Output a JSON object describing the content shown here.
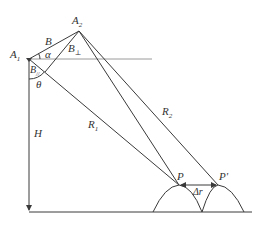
{
  "diagram": {
    "points": {
      "A1": {
        "label": "A",
        "sub": "1",
        "x": 29,
        "y": 59
      },
      "A2": {
        "label": "A",
        "sub": "2",
        "x": 79,
        "y": 31
      },
      "P": {
        "label": "P",
        "x": 179,
        "y": 185
      },
      "Pprime": {
        "label": "P'",
        "x": 218,
        "y": 185
      },
      "foot": {
        "x": 45,
        "y": 72
      }
    },
    "labels": {
      "B": "B",
      "alpha": "α",
      "B_perp": {
        "main": "B",
        "sub": "⊥"
      },
      "B_par": {
        "main": "B",
        "sub": "//"
      },
      "theta": "θ",
      "H": "H",
      "R1": {
        "main": "R",
        "sub": "1"
      },
      "R2": {
        "main": "R",
        "sub": "2"
      },
      "delta_r": "Δr"
    },
    "colors": {
      "line": "#3a3a3a",
      "horizontal_ref": "#9a9a9a",
      "text": "#333333"
    }
  }
}
